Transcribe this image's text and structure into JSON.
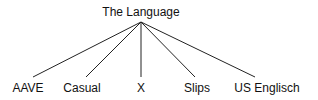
{
  "tree": {
    "root": {
      "label": "The Language",
      "x": 141,
      "y": 5
    },
    "apex": {
      "x": 141,
      "y": 22
    },
    "leaves": [
      {
        "label": "AAVE",
        "x": 28,
        "lx": 33
      },
      {
        "label": "Casual",
        "x": 82,
        "lx": 86
      },
      {
        "label": "X",
        "x": 141,
        "lx": 141
      },
      {
        "label": "Slips",
        "x": 197,
        "lx": 195
      },
      {
        "label": "US Englisch",
        "x": 267,
        "lx": 255
      }
    ],
    "leaf_line_y": 77,
    "leaf_label_y": 80,
    "line_color": "#222222"
  }
}
